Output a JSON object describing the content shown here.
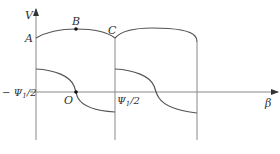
{
  "diagram": {
    "axes": {
      "y_label": "V",
      "x_label": "β",
      "left_tick_label": "− Ψ",
      "left_tick_sub": "1",
      "left_tick_suffix": "/2",
      "right_tick_label": "Ψ",
      "right_tick_sub": "1",
      "right_tick_suffix": "/2",
      "origin_label": "O"
    },
    "points": {
      "A": "A",
      "B": "B",
      "C": "C"
    },
    "colors": {
      "line": "#555555",
      "axis": "#888888",
      "text": "#333333",
      "dot": "#111111"
    }
  }
}
